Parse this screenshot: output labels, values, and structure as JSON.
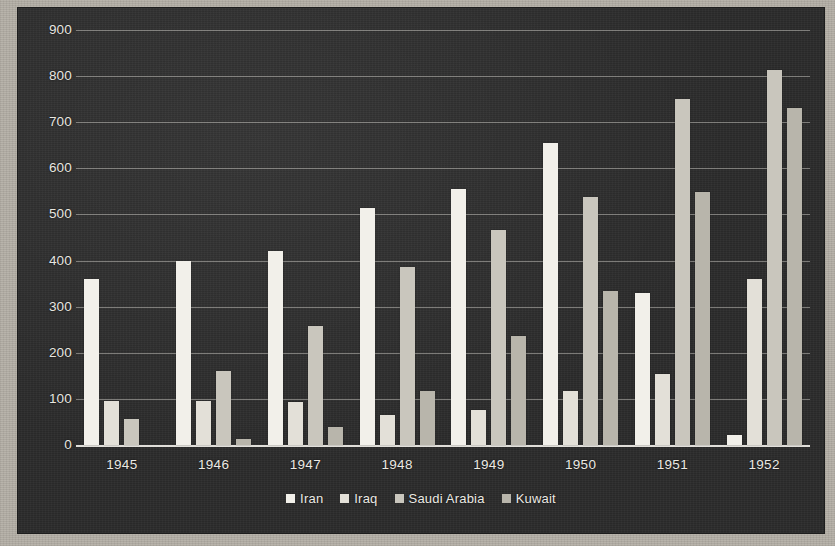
{
  "chart_data": {
    "type": "bar",
    "title": "",
    "xlabel": "",
    "ylabel": "",
    "categories": [
      "1945",
      "1946",
      "1947",
      "1948",
      "1949",
      "1950",
      "1951",
      "1952"
    ],
    "series": [
      {
        "name": "Iran",
        "color": "#f2f0ea",
        "values": [
          360,
          400,
          420,
          515,
          555,
          655,
          330,
          22
        ]
      },
      {
        "name": "Iraq",
        "color": "#e3e0d8",
        "values": [
          95,
          95,
          93,
          65,
          76,
          118,
          155,
          360
        ]
      },
      {
        "name": "Saudi Arabia",
        "color": "#c9c6bd",
        "values": [
          57,
          160,
          258,
          385,
          467,
          538,
          750,
          814
        ]
      },
      {
        "name": "Kuwait",
        "color": "#b8b5ab",
        "values": [
          0,
          12,
          40,
          118,
          236,
          333,
          549,
          731
        ]
      }
    ],
    "ylim": [
      0,
      900
    ],
    "yticks": [
      0,
      100,
      200,
      300,
      400,
      500,
      600,
      700,
      800,
      900
    ],
    "grid": true,
    "legend_position": "bottom",
    "background_color": "#2b2b2b",
    "gridline_color": "#ece9e2"
  }
}
